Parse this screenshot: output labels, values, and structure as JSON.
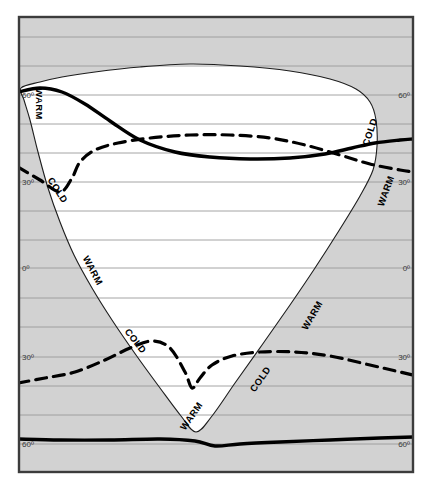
{
  "figure": {
    "type": "map-diagram",
    "background_color": "#ffffff",
    "panel_fill_shaded": "#d2d2d2",
    "panel_fill_clear": "#ffffff",
    "frame_color": "#3c3c3c",
    "gridline_color": "#9a9a9a",
    "curve_color": "#000000"
  },
  "axis": {
    "left_labels": [
      {
        "text": "60º",
        "y": 95
      },
      {
        "text": "30º",
        "y": 182
      },
      {
        "text": "0º",
        "y": 268
      },
      {
        "text": "30º",
        "y": 357
      },
      {
        "text": "60º",
        "y": 444
      }
    ],
    "right_labels": [
      {
        "text": "60º",
        "y": 95
      },
      {
        "text": "30º",
        "y": 182
      },
      {
        "text": "0º",
        "y": 268
      },
      {
        "text": "30º",
        "y": 357
      },
      {
        "text": "60º",
        "y": 444
      }
    ],
    "gridlines_y": [
      37,
      66,
      95,
      124,
      153,
      182,
      211,
      240,
      268,
      298,
      327,
      357,
      386,
      415,
      444,
      473
    ]
  },
  "zone_labels": [
    {
      "text": "WARM",
      "x": 36,
      "y": 104,
      "rotation": 90
    },
    {
      "text": "COLD",
      "x": 55,
      "y": 192,
      "rotation": 57
    },
    {
      "text": "WARM",
      "x": 90,
      "y": 272,
      "rotation": 62
    },
    {
      "text": "COLD",
      "x": 133,
      "y": 343,
      "rotation": 52
    },
    {
      "text": "WARM",
      "x": 194,
      "y": 418,
      "rotation": -55
    },
    {
      "text": "COLD",
      "x": 263,
      "y": 381,
      "rotation": -55
    },
    {
      "text": "WARM",
      "x": 315,
      "y": 317,
      "rotation": -60
    },
    {
      "text": "COLD",
      "x": 373,
      "y": 133,
      "rotation": -72
    },
    {
      "text": "WARM",
      "x": 389,
      "y": 192,
      "rotation": -70
    }
  ],
  "chart_data": {
    "type": "line",
    "title": "",
    "xlabel": "",
    "ylabel": "",
    "series": [
      {
        "name": "inner-region-boundary",
        "style": "thin-solid",
        "color": "#000000",
        "points": [
          [
            21,
            88
          ],
          [
            40,
            82
          ],
          [
            62,
            77
          ],
          [
            95,
            72
          ],
          [
            140,
            67
          ],
          [
            190,
            64
          ],
          [
            240,
            66
          ],
          [
            290,
            71
          ],
          [
            330,
            79
          ],
          [
            356,
            89
          ],
          [
            370,
            102
          ],
          [
            376,
            120
          ],
          [
            377,
            146
          ],
          [
            373,
            170
          ],
          [
            360,
            196
          ],
          [
            340,
            229
          ],
          [
            315,
            268
          ],
          [
            290,
            305
          ],
          [
            262,
            345
          ],
          [
            235,
            383
          ],
          [
            212,
            416
          ],
          [
            196,
            432
          ],
          [
            181,
            416
          ],
          [
            160,
            388
          ],
          [
            136,
            355
          ],
          [
            112,
            320
          ],
          [
            92,
            288
          ],
          [
            74,
            255
          ],
          [
            60,
            222
          ],
          [
            48,
            188
          ],
          [
            38,
            152
          ],
          [
            30,
            120
          ],
          [
            24,
            100
          ],
          [
            21,
            88
          ]
        ]
      },
      {
        "name": "solid-thick-curve-upper",
        "style": "thick-solid",
        "color": "#000000",
        "points": [
          [
            18,
            92
          ],
          [
            40,
            88
          ],
          [
            62,
            92
          ],
          [
            85,
            104
          ],
          [
            110,
            121
          ],
          [
            140,
            140
          ],
          [
            175,
            152
          ],
          [
            210,
            157
          ],
          [
            250,
            159
          ],
          [
            290,
            158
          ],
          [
            325,
            154
          ],
          [
            352,
            148
          ],
          [
            375,
            143
          ],
          [
            400,
            140
          ],
          [
            413,
            139
          ]
        ]
      },
      {
        "name": "dashed-curve-upper",
        "style": "dashed",
        "color": "#000000",
        "points": [
          [
            18,
            167
          ],
          [
            40,
            180
          ],
          [
            60,
            192
          ],
          [
            72,
            178
          ],
          [
            80,
            162
          ],
          [
            95,
            150
          ],
          [
            118,
            143
          ],
          [
            150,
            138
          ],
          [
            190,
            135
          ],
          [
            230,
            135
          ],
          [
            270,
            138
          ],
          [
            305,
            145
          ],
          [
            340,
            155
          ],
          [
            370,
            164
          ],
          [
            400,
            170
          ],
          [
            413,
            172
          ]
        ]
      },
      {
        "name": "dashed-curve-lower",
        "style": "dashed",
        "color": "#000000",
        "points": [
          [
            18,
            383
          ],
          [
            45,
            378
          ],
          [
            75,
            372
          ],
          [
            105,
            360
          ],
          [
            130,
            348
          ],
          [
            152,
            341
          ],
          [
            170,
            348
          ],
          [
            185,
            372
          ],
          [
            192,
            388
          ],
          [
            200,
            378
          ],
          [
            212,
            365
          ],
          [
            232,
            356
          ],
          [
            260,
            352
          ],
          [
            295,
            352
          ],
          [
            330,
            356
          ],
          [
            370,
            365
          ],
          [
            400,
            372
          ],
          [
            413,
            375
          ]
        ]
      },
      {
        "name": "solid-thick-curve-lower",
        "style": "thick-solid",
        "color": "#000000",
        "points": [
          [
            18,
            439
          ],
          [
            60,
            440
          ],
          [
            110,
            440
          ],
          [
            160,
            439
          ],
          [
            195,
            441
          ],
          [
            215,
            446
          ],
          [
            240,
            444
          ],
          [
            280,
            442
          ],
          [
            330,
            440
          ],
          [
            380,
            438
          ],
          [
            413,
            437
          ]
        ]
      }
    ],
    "grid": true,
    "legend": "none"
  }
}
